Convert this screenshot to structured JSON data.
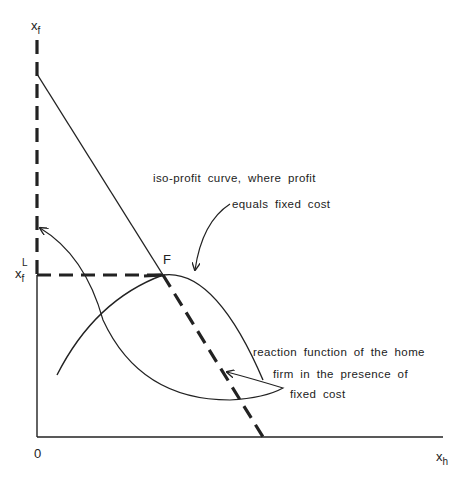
{
  "diagram": {
    "axes": {
      "y_label": "x",
      "y_label_sub": "f",
      "x_label": "x",
      "x_label_sub": "h",
      "origin_label": "0",
      "y_tick_label": "x",
      "y_tick_sub": "f",
      "y_tick_sup": "L"
    },
    "point_label": "F",
    "annotations": {
      "isoprofit_line1": "iso-profit curve, where profit",
      "isoprofit_line2": "equals fixed cost",
      "reaction_line1": "reaction function of the home",
      "reaction_line2": "firm in the presence of",
      "reaction_line3": "fixed cost"
    },
    "colors": {
      "ink": "#222222",
      "background": "#ffffff"
    }
  }
}
